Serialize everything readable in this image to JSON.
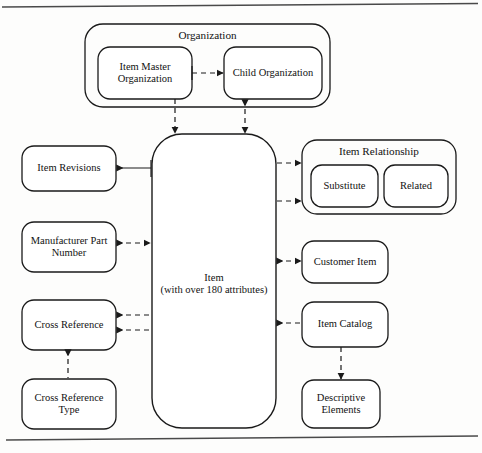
{
  "diagram": {
    "type": "entity-relationship-diagram",
    "page_rules": {
      "top_rule": true,
      "bottom_rule": true
    },
    "groups": [
      {
        "id": "organization",
        "label": "Organization",
        "members": [
          "item-master-organization",
          "child-organization"
        ]
      },
      {
        "id": "item-relationship",
        "label": "Item Relationship",
        "members": [
          "substitute",
          "related"
        ]
      }
    ],
    "nodes": [
      {
        "id": "organization-group",
        "label": "Organization"
      },
      {
        "id": "item-master-organization",
        "label": "Item Master\nOrganization",
        "lines": [
          "Item Master",
          "Organization"
        ]
      },
      {
        "id": "child-organization",
        "label": "Child Organization",
        "lines": [
          "Child Organization"
        ]
      },
      {
        "id": "item",
        "label": "Item (with over 180 attributes)",
        "lines": [
          "Item",
          "(with over 180 attributes)"
        ]
      },
      {
        "id": "item-revisions",
        "label": "Item Revisions",
        "lines": [
          "Item Revisions"
        ]
      },
      {
        "id": "manufacturer-part-number",
        "label": "Manufacturer Part Number",
        "lines": [
          "Manufacturer Part",
          "Number"
        ]
      },
      {
        "id": "cross-reference",
        "label": "Cross Reference",
        "lines": [
          "Cross Reference"
        ]
      },
      {
        "id": "cross-reference-type",
        "label": "Cross Reference Type",
        "lines": [
          "Cross Reference",
          "Type"
        ]
      },
      {
        "id": "item-relationship-group",
        "label": "Item Relationship"
      },
      {
        "id": "substitute",
        "label": "Substitute",
        "lines": [
          "Substitute"
        ]
      },
      {
        "id": "related",
        "label": "Related",
        "lines": [
          "Related"
        ]
      },
      {
        "id": "customer-item",
        "label": "Customer Item",
        "lines": [
          "Customer Item"
        ]
      },
      {
        "id": "item-catalog",
        "label": "Item Catalog",
        "lines": [
          "Item Catalog"
        ]
      },
      {
        "id": "descriptive-elements",
        "label": "Descriptive Elements",
        "lines": [
          "Descriptive",
          "Elements"
        ]
      }
    ],
    "edges": [
      {
        "from": "item-master-organization",
        "to": "child-organization",
        "style": "dashed",
        "label": ""
      },
      {
        "from": "item-master-organization",
        "to": "item",
        "style": "dashed",
        "label": ""
      },
      {
        "from": "child-organization",
        "to": "item",
        "style": "dashed",
        "label": ""
      },
      {
        "from": "item-revisions",
        "to": "item",
        "style": "solid",
        "label": ""
      },
      {
        "from": "manufacturer-part-number",
        "to": "item",
        "style": "dashed",
        "label": ""
      },
      {
        "from": "cross-reference",
        "to": "item",
        "style": "dashed",
        "label": ""
      },
      {
        "from": "cross-reference",
        "to": "item",
        "style": "dashed",
        "label": ""
      },
      {
        "from": "cross-reference",
        "to": "cross-reference-type",
        "style": "dashed",
        "label": ""
      },
      {
        "from": "item",
        "to": "item-relationship-group",
        "style": "dashed",
        "label": ""
      },
      {
        "from": "item",
        "to": "item-relationship-group",
        "style": "dashed",
        "label": ""
      },
      {
        "from": "item",
        "to": "customer-item",
        "style": "dashed",
        "label": ""
      },
      {
        "from": "item",
        "to": "item-catalog",
        "style": "dashed",
        "label": ""
      },
      {
        "from": "item-catalog",
        "to": "descriptive-elements",
        "style": "dashed",
        "label": ""
      }
    ],
    "colors": {
      "stroke": "#1a1a1a",
      "background": "#fdfdfc",
      "text": "#121212",
      "rule": "#4a4a4a"
    }
  }
}
